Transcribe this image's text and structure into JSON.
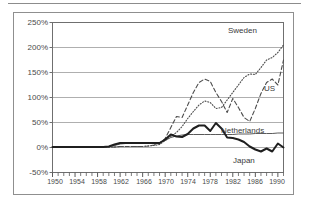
{
  "chart_data": {
    "type": "line",
    "title": "",
    "subtitle": "",
    "xlabel": "",
    "ylabel": "",
    "xlim": [
      1950,
      1991
    ],
    "ylim": [
      -50,
      250
    ],
    "grid": true,
    "gridlines_y": [
      -50,
      0,
      50,
      100,
      150,
      200,
      250
    ],
    "legend_position": "inline-right",
    "y_ticks": [
      "-50%",
      "0%",
      "50%",
      "100%",
      "150%",
      "200%",
      "250%"
    ],
    "y_tick_values": [
      -50,
      0,
      50,
      100,
      150,
      200,
      250
    ],
    "x_ticks": [
      "1950",
      "1954",
      "1958",
      "1962",
      "1966",
      "1970",
      "1974",
      "1978",
      "1982",
      "1986",
      "1990"
    ],
    "x_tick_values": [
      1950,
      1954,
      1958,
      1962,
      1966,
      1970,
      1974,
      1978,
      1982,
      1986,
      1990
    ],
    "x_minor_tick_step": 1,
    "x": [
      1950,
      1951,
      1952,
      1953,
      1954,
      1955,
      1956,
      1957,
      1958,
      1959,
      1960,
      1961,
      1962,
      1963,
      1964,
      1965,
      1966,
      1967,
      1968,
      1969,
      1970,
      1971,
      1972,
      1973,
      1974,
      1975,
      1976,
      1977,
      1978,
      1979,
      1980,
      1981,
      1982,
      1983,
      1984,
      1985,
      1986,
      1987,
      1988,
      1989,
      1990,
      1991
    ],
    "series": [
      {
        "name": "Sweden",
        "style": "dotted",
        "color": "#4d4d4d",
        "width": 1.1,
        "label_x": 1984,
        "label_y": 222,
        "values": [
          1,
          1,
          1,
          1,
          1,
          1,
          1,
          1,
          1,
          1,
          1,
          1,
          2,
          2,
          2,
          2,
          2,
          3,
          4,
          6,
          14,
          22,
          30,
          42,
          58,
          72,
          85,
          93,
          90,
          78,
          80,
          95,
          110,
          125,
          140,
          147,
          146,
          160,
          175,
          180,
          190,
          205
        ]
      },
      {
        "name": "US",
        "style": "dashed",
        "color": "#4d4d4d",
        "width": 1.1,
        "label_x": 1988,
        "label_y": 112,
        "values": [
          1,
          1,
          1,
          1,
          1,
          1,
          1,
          1,
          1,
          1,
          1,
          1,
          2,
          2,
          2,
          2,
          2,
          3,
          5,
          8,
          18,
          40,
          62,
          60,
          85,
          110,
          130,
          137,
          132,
          110,
          92,
          70,
          98,
          80,
          60,
          52,
          78,
          108,
          130,
          137,
          125,
          175
        ]
      },
      {
        "name": "Netherlands",
        "style": "solid-thin",
        "color": "#5a5a5a",
        "width": 1.0,
        "label_x": 1983,
        "label_y": 40,
        "values": [
          1,
          1,
          1,
          1,
          1,
          1,
          1,
          1,
          1,
          1,
          2,
          4,
          7,
          8,
          8,
          8,
          8,
          8,
          9,
          10,
          14,
          20,
          23,
          25,
          26,
          26,
          26,
          26,
          26,
          26,
          26,
          26,
          26,
          27,
          27,
          27,
          28,
          28,
          28,
          28,
          29,
          29
        ]
      },
      {
        "name": "Japan",
        "style": "solid-thick",
        "color": "#1f1f1f",
        "width": 2.0,
        "label_x": 1984,
        "label_y": -31,
        "values": [
          1,
          1,
          1,
          1,
          1,
          1,
          1,
          1,
          1,
          1,
          2,
          6,
          9,
          9,
          9,
          9,
          9,
          9,
          9,
          9,
          16,
          26,
          22,
          21,
          27,
          38,
          44,
          44,
          33,
          49,
          38,
          20,
          19,
          16,
          11,
          2,
          -4,
          -8,
          -2,
          -8,
          8,
          0
        ]
      }
    ]
  },
  "axes": {
    "y_axis_name": "percent-axis",
    "x_axis_name": "year-axis"
  }
}
